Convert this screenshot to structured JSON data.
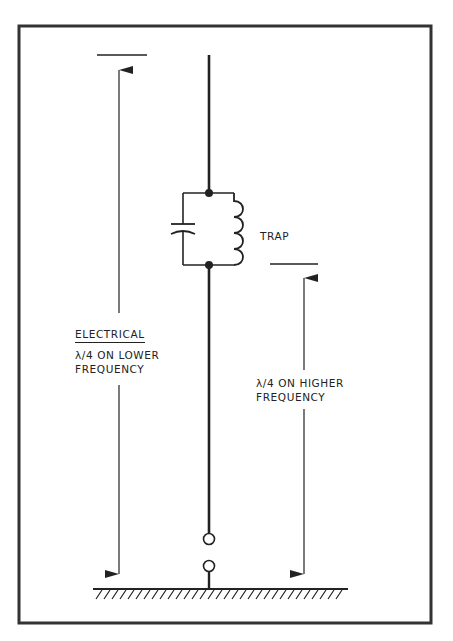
{
  "figure": {
    "type": "trap antenna schematic",
    "colors": {
      "ink": "#222222",
      "frame": "#333333",
      "background": "#ffffff"
    }
  },
  "labels": {
    "trap": "TRAP",
    "left_dimension": {
      "line1": "ELECTRICAL",
      "line2": "λ/4  ON LOWER",
      "line3": "FREQUENCY"
    },
    "right_dimension": {
      "line1": "λ/4  ON HIGHER",
      "line2": "FREQUENCY"
    }
  },
  "components": [
    {
      "name": "antenna-element",
      "kind": "vertical conductor"
    },
    {
      "name": "trap",
      "kind": "parallel LC circuit",
      "parts": [
        "capacitor",
        "inductor"
      ]
    },
    {
      "name": "feed-terminals",
      "kind": "two open-circle terminals"
    },
    {
      "name": "ground-plane",
      "kind": "hatched ground"
    }
  ]
}
